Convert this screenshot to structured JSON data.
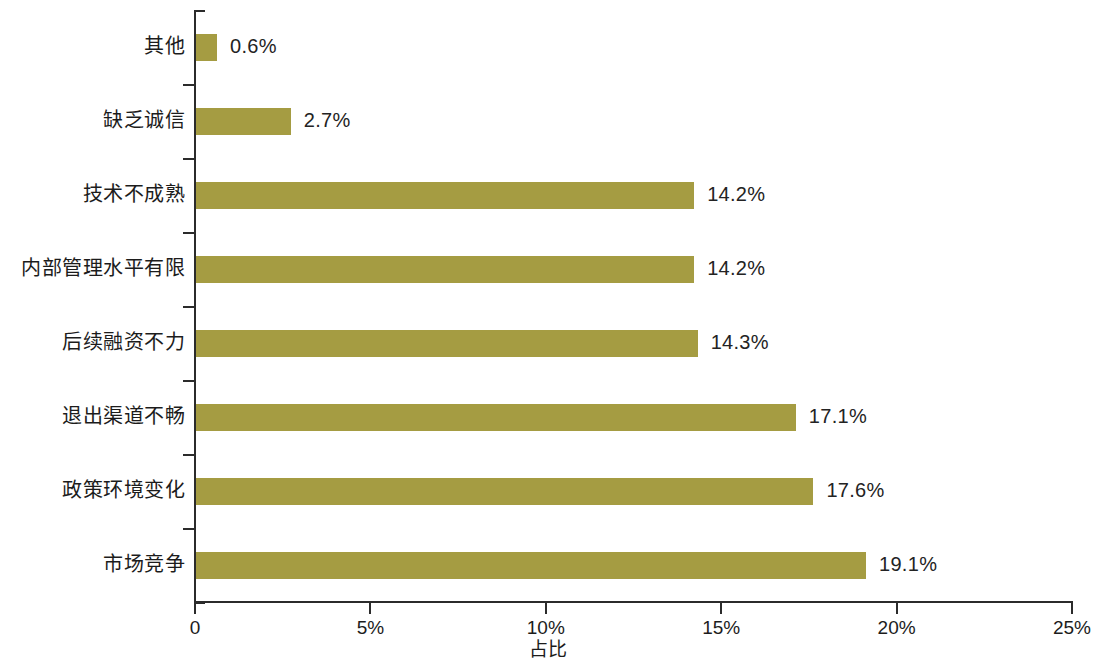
{
  "chart_data": {
    "type": "bar",
    "orientation": "horizontal",
    "title": "",
    "xlabel": "占比",
    "ylabel": "",
    "xlim": [
      0,
      25
    ],
    "xunit": "%",
    "grid": false,
    "legend": null,
    "bar_color": "#a59c42",
    "axis_color": "#2b2b2b",
    "xticks": [
      {
        "value": 0,
        "label": "0"
      },
      {
        "value": 5,
        "label": "5%"
      },
      {
        "value": 10,
        "label": "10%"
      },
      {
        "value": 15,
        "label": "15%"
      },
      {
        "value": 20,
        "label": "20%"
      },
      {
        "value": 25,
        "label": "25%"
      }
    ],
    "categories": [
      "其他",
      "缺乏诚信",
      "技术不成熟",
      "内部管理水平有限",
      "后续融资不力",
      "退出渠道不畅",
      "政策环境变化",
      "市场竞争"
    ],
    "values": [
      0.6,
      2.7,
      14.2,
      14.2,
      14.3,
      17.1,
      17.6,
      19.1
    ],
    "value_labels": [
      "0.6%",
      "2.7%",
      "14.2%",
      "14.2%",
      "14.3%",
      "17.1%",
      "17.6%",
      "19.1%"
    ]
  }
}
